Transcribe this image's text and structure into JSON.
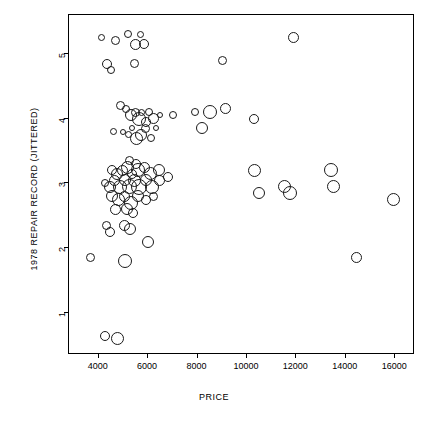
{
  "chart_data": {
    "type": "scatter",
    "title": "",
    "xlabel": "PRICE",
    "ylabel": "1978 REPAIR RECORD (JITTERED)",
    "xlim": [
      2800,
      16800
    ],
    "ylim": [
      0.35,
      5.6
    ],
    "xticks": [
      4000,
      6000,
      8000,
      10000,
      12000,
      14000,
      16000
    ],
    "yticks": [
      1,
      2,
      3,
      4,
      5
    ],
    "grid": false,
    "legend": null,
    "marker": "open-circle",
    "size_encodes": "weight",
    "points": [
      {
        "x": 4100,
        "y": 5.25,
        "s": 7
      },
      {
        "x": 4700,
        "y": 5.2,
        "s": 9
      },
      {
        "x": 5200,
        "y": 5.3,
        "s": 8
      },
      {
        "x": 5500,
        "y": 5.15,
        "s": 11
      },
      {
        "x": 5700,
        "y": 5.3,
        "s": 7
      },
      {
        "x": 5850,
        "y": 5.15,
        "s": 10
      },
      {
        "x": 4350,
        "y": 4.85,
        "s": 10
      },
      {
        "x": 4500,
        "y": 4.75,
        "s": 8
      },
      {
        "x": 5450,
        "y": 4.85,
        "s": 9
      },
      {
        "x": 9000,
        "y": 4.9,
        "s": 9
      },
      {
        "x": 11900,
        "y": 5.25,
        "s": 11
      },
      {
        "x": 4900,
        "y": 4.2,
        "s": 9
      },
      {
        "x": 5100,
        "y": 4.15,
        "s": 8
      },
      {
        "x": 5300,
        "y": 4.05,
        "s": 12
      },
      {
        "x": 5500,
        "y": 4.1,
        "s": 9
      },
      {
        "x": 5650,
        "y": 4.0,
        "s": 14
      },
      {
        "x": 5750,
        "y": 4.1,
        "s": 7
      },
      {
        "x": 5900,
        "y": 3.95,
        "s": 10
      },
      {
        "x": 6050,
        "y": 4.1,
        "s": 8
      },
      {
        "x": 6200,
        "y": 4.0,
        "s": 11
      },
      {
        "x": 6500,
        "y": 4.05,
        "s": 6
      },
      {
        "x": 7000,
        "y": 4.05,
        "s": 8
      },
      {
        "x": 7900,
        "y": 4.1,
        "s": 8
      },
      {
        "x": 8500,
        "y": 4.1,
        "s": 14
      },
      {
        "x": 9150,
        "y": 4.15,
        "s": 11
      },
      {
        "x": 10300,
        "y": 4.0,
        "s": 10
      },
      {
        "x": 4600,
        "y": 3.8,
        "s": 7
      },
      {
        "x": 5000,
        "y": 3.8,
        "s": 6
      },
      {
        "x": 5200,
        "y": 3.75,
        "s": 7
      },
      {
        "x": 5350,
        "y": 3.85,
        "s": 6
      },
      {
        "x": 5550,
        "y": 3.7,
        "s": 13
      },
      {
        "x": 5700,
        "y": 3.75,
        "s": 12
      },
      {
        "x": 5900,
        "y": 3.85,
        "s": 9
      },
      {
        "x": 6100,
        "y": 3.7,
        "s": 8
      },
      {
        "x": 6300,
        "y": 3.85,
        "s": 6
      },
      {
        "x": 8200,
        "y": 3.85,
        "s": 12
      },
      {
        "x": 5250,
        "y": 3.35,
        "s": 9
      },
      {
        "x": 5500,
        "y": 3.3,
        "s": 10
      },
      {
        "x": 4550,
        "y": 3.2,
        "s": 10
      },
      {
        "x": 4750,
        "y": 3.15,
        "s": 12
      },
      {
        "x": 4950,
        "y": 3.2,
        "s": 11
      },
      {
        "x": 5150,
        "y": 3.25,
        "s": 13
      },
      {
        "x": 5350,
        "y": 3.15,
        "s": 10
      },
      {
        "x": 5600,
        "y": 3.2,
        "s": 14
      },
      {
        "x": 5850,
        "y": 3.25,
        "s": 11
      },
      {
        "x": 6100,
        "y": 3.15,
        "s": 13
      },
      {
        "x": 6450,
        "y": 3.2,
        "s": 12
      },
      {
        "x": 6800,
        "y": 3.1,
        "s": 10
      },
      {
        "x": 4250,
        "y": 3.0,
        "s": 8
      },
      {
        "x": 4450,
        "y": 2.95,
        "s": 12
      },
      {
        "x": 4650,
        "y": 3.05,
        "s": 11
      },
      {
        "x": 4850,
        "y": 2.95,
        "s": 14
      },
      {
        "x": 5050,
        "y": 3.05,
        "s": 12
      },
      {
        "x": 5250,
        "y": 2.95,
        "s": 15
      },
      {
        "x": 5450,
        "y": 3.05,
        "s": 13
      },
      {
        "x": 5650,
        "y": 2.95,
        "s": 16
      },
      {
        "x": 5900,
        "y": 3.05,
        "s": 12
      },
      {
        "x": 6150,
        "y": 2.95,
        "s": 14
      },
      {
        "x": 6450,
        "y": 3.05,
        "s": 11
      },
      {
        "x": 4550,
        "y": 2.8,
        "s": 12
      },
      {
        "x": 4800,
        "y": 2.75,
        "s": 13
      },
      {
        "x": 5050,
        "y": 2.8,
        "s": 11
      },
      {
        "x": 5300,
        "y": 2.7,
        "s": 14
      },
      {
        "x": 5600,
        "y": 2.8,
        "s": 12
      },
      {
        "x": 5900,
        "y": 2.75,
        "s": 10
      },
      {
        "x": 6200,
        "y": 2.8,
        "s": 9
      },
      {
        "x": 4700,
        "y": 2.6,
        "s": 11
      },
      {
        "x": 5150,
        "y": 2.6,
        "s": 12
      },
      {
        "x": 5400,
        "y": 2.55,
        "s": 10
      },
      {
        "x": 10300,
        "y": 3.2,
        "s": 13
      },
      {
        "x": 10500,
        "y": 2.85,
        "s": 12
      },
      {
        "x": 11500,
        "y": 2.95,
        "s": 13
      },
      {
        "x": 11750,
        "y": 2.85,
        "s": 14
      },
      {
        "x": 13400,
        "y": 3.2,
        "s": 14
      },
      {
        "x": 13500,
        "y": 2.95,
        "s": 13
      },
      {
        "x": 15950,
        "y": 2.75,
        "s": 13
      },
      {
        "x": 4300,
        "y": 2.35,
        "s": 9
      },
      {
        "x": 4450,
        "y": 2.25,
        "s": 10
      },
      {
        "x": 5050,
        "y": 2.35,
        "s": 11
      },
      {
        "x": 5250,
        "y": 2.3,
        "s": 12
      },
      {
        "x": 6000,
        "y": 2.1,
        "s": 12
      },
      {
        "x": 3650,
        "y": 1.85,
        "s": 9
      },
      {
        "x": 5050,
        "y": 1.8,
        "s": 14
      },
      {
        "x": 14450,
        "y": 1.85,
        "s": 11
      },
      {
        "x": 4250,
        "y": 0.65,
        "s": 10
      },
      {
        "x": 4750,
        "y": 0.6,
        "s": 13
      }
    ]
  }
}
